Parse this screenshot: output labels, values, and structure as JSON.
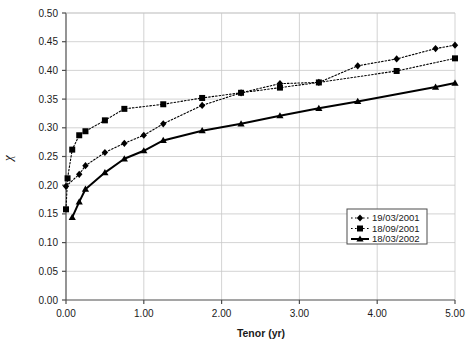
{
  "chart_data": {
    "type": "line",
    "title": "",
    "xlabel": "Tenor (yr)",
    "ylabel": "χ",
    "xlim": [
      0.0,
      5.0
    ],
    "ylim": [
      0.0,
      0.5
    ],
    "xticks": [
      "0.00",
      "1.00",
      "2.00",
      "3.00",
      "4.00",
      "5.00"
    ],
    "xtick_values": [
      0,
      1,
      2,
      3,
      4,
      5
    ],
    "yticks": [
      "0.00",
      "0.05",
      "0.10",
      "0.15",
      "0.20",
      "0.25",
      "0.30",
      "0.35",
      "0.40",
      "0.45",
      "0.50"
    ],
    "ytick_values": [
      0,
      0.05,
      0.1,
      0.15,
      0.2,
      0.25,
      0.3,
      0.35,
      0.4,
      0.45,
      0.5
    ],
    "grid": true,
    "grid_axis": "both",
    "legend_position": "lower-right",
    "line_color": "#000000",
    "grid_color": "#c8c8c8",
    "axis_color": "#4d4d4d",
    "background": "#ffffff",
    "series": [
      {
        "name": "19/03/2001",
        "marker": "diamond",
        "linestyle": "dotted",
        "color": "#000000",
        "points": [
          [
            0.0,
            0.198
          ],
          [
            0.17,
            0.219
          ],
          [
            0.25,
            0.234
          ],
          [
            0.5,
            0.257
          ],
          [
            0.75,
            0.273
          ],
          [
            1.0,
            0.287
          ],
          [
            1.25,
            0.307
          ],
          [
            1.75,
            0.339
          ],
          [
            2.25,
            0.361
          ],
          [
            2.75,
            0.377
          ],
          [
            3.25,
            0.379
          ],
          [
            3.75,
            0.408
          ],
          [
            4.25,
            0.42
          ],
          [
            4.75,
            0.438
          ],
          [
            5.0,
            0.444
          ]
        ]
      },
      {
        "name": "18/09/2001",
        "marker": "square",
        "linestyle": "dotted",
        "color": "#000000",
        "points": [
          [
            0.0,
            0.158
          ],
          [
            0.02,
            0.212
          ],
          [
            0.08,
            0.262
          ],
          [
            0.17,
            0.287
          ],
          [
            0.25,
            0.294
          ],
          [
            0.5,
            0.313
          ],
          [
            0.75,
            0.333
          ],
          [
            1.25,
            0.341
          ],
          [
            1.75,
            0.352
          ],
          [
            2.25,
            0.361
          ],
          [
            2.75,
            0.37
          ],
          [
            3.25,
            0.379
          ],
          [
            4.25,
            0.399
          ],
          [
            5.0,
            0.421
          ]
        ]
      },
      {
        "name": "18/03/2002",
        "marker": "triangle",
        "linestyle": "solid",
        "color": "#000000",
        "points": [
          [
            0.08,
            0.144
          ],
          [
            0.17,
            0.171
          ],
          [
            0.25,
            0.193
          ],
          [
            0.5,
            0.222
          ],
          [
            0.75,
            0.246
          ],
          [
            1.0,
            0.26
          ],
          [
            1.25,
            0.278
          ],
          [
            1.75,
            0.295
          ],
          [
            2.25,
            0.307
          ],
          [
            2.75,
            0.321
          ],
          [
            3.25,
            0.334
          ],
          [
            3.75,
            0.346
          ],
          [
            4.75,
            0.371
          ],
          [
            5.0,
            0.378
          ]
        ]
      }
    ]
  }
}
